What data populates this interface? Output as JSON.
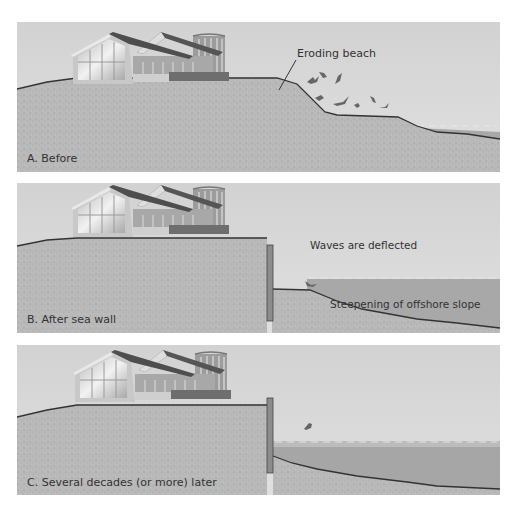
{
  "colors": {
    "sky": "#d6d6d6",
    "sand": "#b7b7b7",
    "water": "#a8a8a8",
    "line": "#3a3a3a",
    "wall": "#8c8c8c",
    "roof": "#555555",
    "house_wall": "#c4c4c4",
    "glass": "#e6e6e6"
  },
  "panels": [
    {
      "id": "A",
      "caption": "A. Before",
      "annotations": [
        {
          "text": "Eroding beach"
        }
      ]
    },
    {
      "id": "B",
      "caption": "B. After sea wall",
      "annotations": [
        {
          "text": "Waves are deflected"
        },
        {
          "text": "Steepening of offshore slope"
        }
      ]
    },
    {
      "id": "C",
      "caption": "C. Several decades (or more) later",
      "annotations": []
    }
  ]
}
